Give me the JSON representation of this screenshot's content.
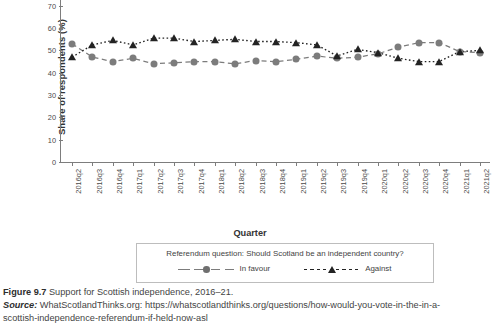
{
  "figure": {
    "number_label": "Figure 9.7",
    "caption": "Support for Scottish independence, 2016–21.",
    "source_label": "Source:",
    "source_text": "WhatScotlandThinks.org: https://whatscotlandthinks.org/questions/how-would-you-vote-in-the-in-a-",
    "source_text_line2": "scottish-independence-referendum-if-held-now-asl"
  },
  "legend": {
    "question": "Referendum question: Should Scotland be an independent country?",
    "items": [
      {
        "label": "In favour",
        "marker": "circle-marker",
        "line": "dashed",
        "color": "#7c7c7c"
      },
      {
        "label": "Against",
        "marker": "triangle-marker",
        "line": "dotted",
        "color": "#232323"
      }
    ]
  },
  "chart_data": {
    "type": "line",
    "title": "",
    "xlabel": "Quarter",
    "ylabel": "Share of respondents (%)",
    "ylim": [
      0,
      78
    ],
    "yticks": [
      0,
      10,
      20,
      30,
      40,
      50,
      60,
      70
    ],
    "grid": false,
    "legend_position": "bottom",
    "categories": [
      "2016q2",
      "2016q3",
      "2016q4",
      "2017q1",
      "2017q2",
      "2017q3",
      "2017q4",
      "2018q1",
      "2018q2",
      "2018q3",
      "2018q4",
      "2019q1",
      "2019q2",
      "2019q3",
      "2019q4",
      "2020q1",
      "2020q2",
      "2020q3",
      "2020q4",
      "2021q1",
      "2021q2"
    ],
    "series": [
      {
        "name": "In favour",
        "color": "#7c7c7c",
        "values": [
          53,
          47,
          45,
          46.5,
          44,
          44.5,
          45,
          45,
          44,
          45.5,
          45,
          46,
          47.5,
          46.5,
          47,
          48.5,
          51.5,
          53.5,
          53.5,
          49.5,
          49
        ]
      },
      {
        "name": "Against",
        "color": "#232323",
        "values": [
          47,
          52.5,
          54.5,
          52.5,
          55.5,
          55.5,
          54,
          54.5,
          55,
          54,
          54,
          53.5,
          52.5,
          47.5,
          50.5,
          49,
          46.5,
          45,
          45,
          49.5,
          50
        ]
      }
    ]
  }
}
